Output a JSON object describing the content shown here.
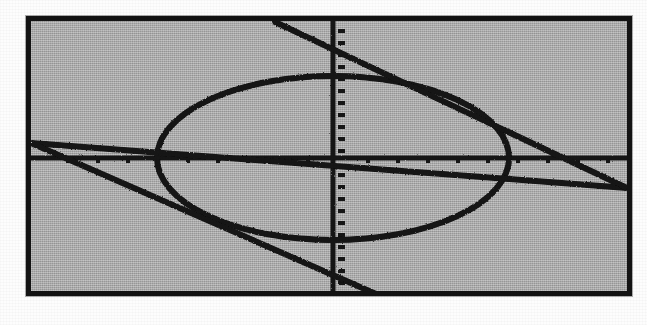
{
  "document": {
    "kind": "graphing-calculator-screenshot",
    "description": "Graphing calculator display showing an ellipse intersected by two straight lines",
    "page_background": "#fdfdfd"
  },
  "calculator": {
    "bezel_color": "#141414",
    "bezel_thickness_px": 5,
    "screen_background": "#a8a8a8",
    "trace_color": "#131313",
    "screen": {
      "x": 26,
      "y": 16,
      "width": 606,
      "height": 280
    }
  },
  "chart_data": {
    "type": "line",
    "title": "",
    "subtitle": "",
    "xlabel": "",
    "ylabel": "",
    "grid": false,
    "legend_position": "none",
    "axes": {
      "x_axis_visible": true,
      "y_axis_visible": true,
      "x_axis_pixel_y": 158,
      "y_axis_pixel_x": 333,
      "x_tick_spacing_px": 30,
      "y_tick_spacing_px": 12,
      "tick_marks": true,
      "xlim": [
        -10,
        10
      ],
      "ylim": [
        -6.2,
        6.2
      ],
      "xscl": 1,
      "yscl": 0.5
    },
    "series": [
      {
        "name": "ellipse",
        "kind": "conic-ellipse",
        "center": [
          0,
          0
        ],
        "semi_axis_x": 5.8,
        "semi_axis_y": 3.4,
        "pixel_center": [
          333,
          158
        ],
        "pixel_radius_x": 176,
        "pixel_radius_y": 82,
        "equation": "x^2/34 + y^2/11.5 = 1"
      },
      {
        "name": "line-ascending",
        "kind": "line",
        "slope": -0.13,
        "intercept": -0.15,
        "pixel_start": [
          31,
          141
        ],
        "pixel_end": [
          631,
          180
        ],
        "note": "shallow line from upper-left to lower-right crossing the x-axis near x=595px"
      },
      {
        "name": "line-descending",
        "kind": "line",
        "slope": -1.0,
        "intercept": 0.55,
        "pixel_start": [
          268,
          21
        ],
        "pixel_end": [
          378,
          292
        ],
        "note": "steep line entering the top of the screen and exiting the bottom",
        "secondary_pixel_start": [
          268,
          21
        ],
        "secondary_pixel_end": [
          631,
          180
        ]
      }
    ],
    "intersections": [
      {
        "label": "ellipse-x-vertex-left",
        "pixel": [
          157,
          158
        ]
      },
      {
        "label": "ellipse-x-vertex-right",
        "pixel": [
          509,
          158
        ]
      },
      {
        "label": "ellipse-y-vertex-top",
        "pixel": [
          333,
          76
        ]
      },
      {
        "label": "ellipse-y-vertex-bottom",
        "pixel": [
          333,
          234
        ]
      }
    ]
  }
}
